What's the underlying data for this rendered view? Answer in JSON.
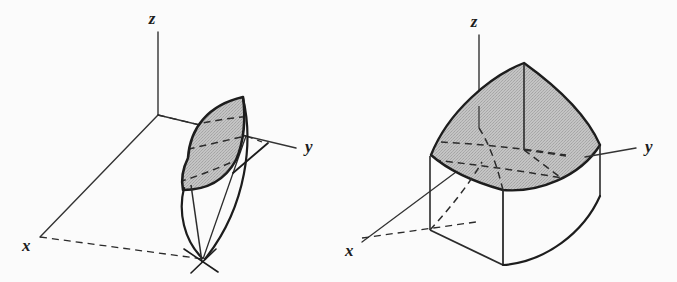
{
  "page": {
    "background_color": "#fbfbfb",
    "width": 677,
    "height": 282
  },
  "style": {
    "stroke_color": "#1d1d1d",
    "stroke_color_soft": "#3a3a3a",
    "axis_color": "#333333",
    "shade_fill": "#b9b9b9",
    "shade_fill_light": "#c2c2c2",
    "outline_width": 2.4,
    "thin_width": 1.2,
    "axis_width": 1.3,
    "dash_pattern": "7 5"
  },
  "figures": [
    {
      "id": "figure-left",
      "name": "lens-shaped-solid",
      "caption": "",
      "axes": {
        "origin": {
          "x": 158,
          "y": 115
        },
        "z": {
          "label": "z",
          "label_pos": {
            "x": 152,
            "y": 24
          },
          "tip": {
            "x": 158,
            "y": 32
          }
        },
        "y": {
          "label": "y",
          "label_pos": {
            "x": 305,
            "y": 152
          },
          "tip": {
            "x": 296,
            "y": 148
          }
        },
        "x": {
          "label": "x",
          "label_pos": {
            "x": 22,
            "y": 251
          },
          "tip": {
            "x": 40,
            "y": 237
          }
        }
      },
      "shaded_patch": {
        "name": "lens-cross-section",
        "fill": "#b9b9b9",
        "path": "M 188 158 C 190 128 208 105 243 97 C 246 118 244 142 236 160 C 224 182 204 190 183 190 C 181 180 183 168 188 158 Z"
      },
      "dashed_curves_on_patch": 3,
      "base_point": {
        "x": 203,
        "y": 259
      }
    },
    {
      "id": "figure-right",
      "name": "saddle-topped-solid",
      "caption": "",
      "axes": {
        "origin": {
          "x": 499,
          "y": 140
        },
        "z": {
          "label": "z",
          "label_pos": {
            "x": 474,
            "y": 27
          },
          "tip": {
            "x": 479,
            "y": 35
          }
        },
        "y": {
          "label": "y",
          "label_pos": {
            "x": 645,
            "y": 152
          },
          "tip": {
            "x": 636,
            "y": 148
          }
        },
        "x": {
          "label": "x",
          "label_pos": {
            "x": 345,
            "y": 256
          },
          "tip": {
            "x": 362,
            "y": 242
          }
        }
      },
      "shaded_patch": {
        "name": "saddle-top-surface",
        "fill": "#b9b9b9",
        "path": "M 431 155 C 448 112 490 76 524 63 C 556 86 586 113 600 145 C 580 177 538 193 503 190 C 474 182 448 170 431 155 Z"
      },
      "dashed_curves_on_patch": 3,
      "side_faces": 2
    }
  ],
  "labels": {
    "x": "x",
    "y": "y",
    "z": "z"
  }
}
